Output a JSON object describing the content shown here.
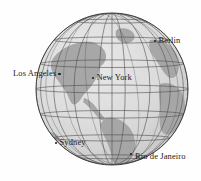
{
  "figure": {
    "type": "globe-map",
    "projection": "orthographic",
    "background_color": "#fefefe",
    "ocean_color": "#d9d9d9",
    "land_color": "#9e9e9e",
    "graticule_color": "#4a4a4a",
    "outline_color": "#3a3a3a",
    "globe": {
      "center_x": 112,
      "center_y": 89,
      "radius": 76
    },
    "graticule": {
      "meridian_step_deg": 20,
      "parallel_step_deg": 20,
      "visible": true
    }
  },
  "cities": [
    {
      "name": "Berlin",
      "label": "Berlin",
      "marker_x": 156,
      "marker_y": 42,
      "label_side": "right",
      "dot_style": "dot-left"
    },
    {
      "name": "Los Angeles",
      "label": "Los Angeles",
      "marker_x": 64,
      "marker_y": 75,
      "label_side": "left",
      "dot_style": "dot-right"
    },
    {
      "name": "New York",
      "label": "New York",
      "marker_x": 95,
      "marker_y": 79,
      "label_side": "right",
      "dot_style": "dot-left"
    },
    {
      "name": "Sydney",
      "label": "Sydney",
      "marker_x": 57,
      "marker_y": 144,
      "label_side": "right",
      "dot_style": "dot-left"
    },
    {
      "name": "Rio de Janeiro",
      "label": "Rio de Janeiro",
      "marker_x": 132,
      "marker_y": 156,
      "label_side": "right",
      "dot_style": "dot-upleft"
    }
  ]
}
